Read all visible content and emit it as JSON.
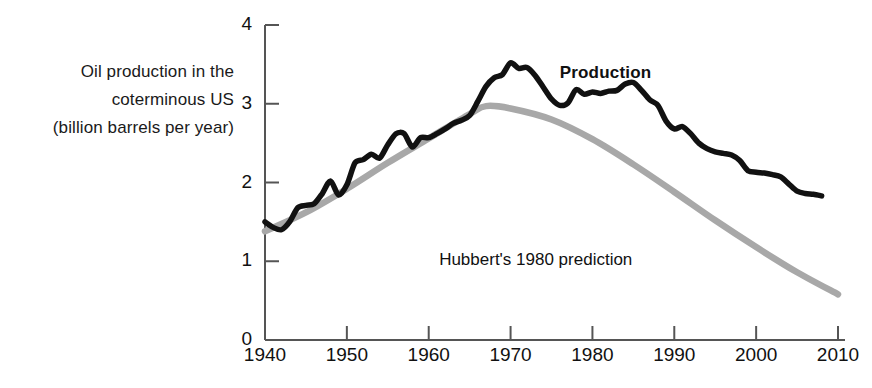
{
  "figure": {
    "background_color": "#ffffff",
    "width": 872,
    "height": 388
  },
  "axis_caption": {
    "line1": "Oil production in the",
    "line2": "coterminous US",
    "line3": "(billion barrels per year)",
    "full": "Oil production in the coterminous US (billion barrels per year)"
  },
  "labels": {
    "production": "Production",
    "prediction": "Hubbert's 1980 prediction"
  },
  "colors": {
    "production_line": "#111111",
    "prediction_line": "#a8a8a8",
    "axis": "#555555",
    "text": "#111111"
  },
  "chart_data": {
    "type": "line",
    "title": "",
    "xlabel": "",
    "ylabel": "Oil production in the coterminous US (billion barrels per year)",
    "xlim": [
      1940,
      2010
    ],
    "ylim": [
      0,
      4
    ],
    "grid": false,
    "legend_position": "inline-annotation",
    "xticks": [
      1940,
      1950,
      1960,
      1970,
      1980,
      1990,
      2000,
      2010
    ],
    "yticks": [
      0,
      1,
      2,
      3,
      4
    ],
    "series": [
      {
        "name": "Production",
        "color": "#111111",
        "style": "solid-thick",
        "x": [
          1940,
          1941,
          1942,
          1943,
          1944,
          1945,
          1946,
          1947,
          1948,
          1949,
          1950,
          1951,
          1952,
          1953,
          1954,
          1955,
          1956,
          1957,
          1958,
          1959,
          1960,
          1961,
          1962,
          1963,
          1964,
          1965,
          1966,
          1967,
          1968,
          1969,
          1970,
          1971,
          1972,
          1973,
          1974,
          1975,
          1976,
          1977,
          1978,
          1979,
          1980,
          1981,
          1982,
          1983,
          1984,
          1985,
          1986,
          1987,
          1988,
          1989,
          1990,
          1991,
          1992,
          1993,
          1994,
          1995,
          1996,
          1997,
          1998,
          1999,
          2000,
          2001,
          2002,
          2003,
          2004,
          2005,
          2006,
          2007,
          2008
        ],
        "y": [
          1.5,
          1.43,
          1.4,
          1.5,
          1.68,
          1.71,
          1.73,
          1.86,
          2.02,
          1.84,
          1.97,
          2.25,
          2.29,
          2.36,
          2.31,
          2.48,
          2.62,
          2.62,
          2.45,
          2.57,
          2.57,
          2.62,
          2.68,
          2.75,
          2.79,
          2.85,
          3.03,
          3.22,
          3.33,
          3.37,
          3.52,
          3.45,
          3.46,
          3.36,
          3.21,
          3.06,
          2.98,
          3.01,
          3.18,
          3.12,
          3.15,
          3.13,
          3.16,
          3.17,
          3.25,
          3.27,
          3.17,
          3.05,
          2.98,
          2.78,
          2.68,
          2.71,
          2.62,
          2.5,
          2.43,
          2.39,
          2.37,
          2.35,
          2.28,
          2.15,
          2.13,
          2.12,
          2.1,
          2.07,
          1.98,
          1.89,
          1.86,
          1.85,
          1.83
        ],
        "annotation": {
          "text": "Production",
          "x": 1976,
          "y": 3.38
        }
      },
      {
        "name": "Hubbert's 1980 prediction",
        "color": "#a8a8a8",
        "style": "solid-thick-smooth",
        "x": [
          1940,
          1945,
          1950,
          1955,
          1960,
          1965,
          1967,
          1970,
          1975,
          1980,
          1985,
          1990,
          1995,
          2000,
          2005,
          2010
        ],
        "y": [
          1.38,
          1.62,
          1.92,
          2.25,
          2.56,
          2.87,
          2.97,
          2.94,
          2.8,
          2.55,
          2.23,
          1.88,
          1.52,
          1.18,
          0.86,
          0.58
        ],
        "annotation": {
          "text": "Hubbert's 1980 prediction",
          "x": 1973,
          "y": 1.0
        }
      }
    ],
    "notes": {
      "production_peak_year": 1970,
      "production_peak_value": 3.52,
      "prediction_peak_year": 1967,
      "prediction_peak_value": 2.97
    }
  }
}
